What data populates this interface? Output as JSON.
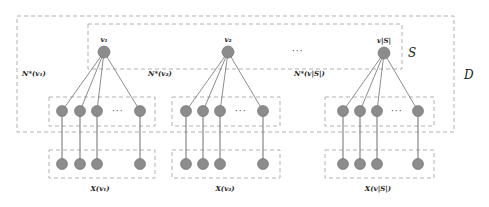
{
  "diagram": {
    "outer_set_label": "D",
    "selected_set_label": "S",
    "between_centers_ellipsis": "···",
    "groups": [
      {
        "center_label": "v₁",
        "neighbor_label": "N*(v₁)",
        "feature_label": "X(v₁)",
        "neighbor_count_visible": 4,
        "ellipsis": "···"
      },
      {
        "center_label": "v₂",
        "neighbor_label": "N*(v₂)",
        "feature_label": "X(v₂)",
        "neighbor_count_visible": 4,
        "ellipsis": "···"
      },
      {
        "center_label": "v|S|",
        "neighbor_label": "N*(v|S|)",
        "feature_label": "X(v|S|)",
        "neighbor_count_visible": 4,
        "ellipsis": "···"
      }
    ],
    "colors": {
      "node_fill": "#8c8c8c",
      "box_stroke": "#a8a8a8",
      "edge": "#6e6e6e"
    }
  }
}
